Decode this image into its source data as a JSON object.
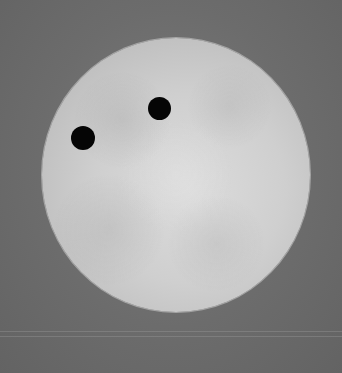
{
  "scene": {
    "description": "Solar disk with two dark transiting bodies",
    "background_color": "#6e6e6e",
    "disk": {
      "cx": 176,
      "cy": 175,
      "rx": 134,
      "ry": 137,
      "color": "#cfcfcf"
    },
    "spots": [
      {
        "name": "left-spot",
        "cx": 83,
        "cy": 138,
        "r": 12
      },
      {
        "name": "right-spot",
        "cx": 160,
        "cy": 109,
        "r": 11.5
      }
    ],
    "streaks_y": [
      331,
      336
    ]
  }
}
